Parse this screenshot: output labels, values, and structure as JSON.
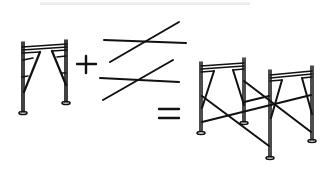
{
  "diagram": {
    "parts": [
      {
        "name": "frame",
        "symbol_after": "+"
      },
      {
        "name": "cross-braces",
        "symbol_after": "="
      },
      {
        "name": "assembled-scaffold"
      }
    ],
    "operators": {
      "plus": "+",
      "equals": "="
    },
    "colors": {
      "line": "#111111",
      "background": "#ffffff"
    }
  }
}
